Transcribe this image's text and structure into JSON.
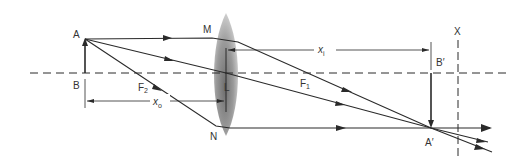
{
  "diagram": {
    "type": "thin converging lens ray diagram",
    "colors": {
      "ink": "#2a2a2a",
      "background": "#ffffff",
      "lens_light": "#c8c8c8",
      "lens_dark": "#6e6e6e"
    },
    "labels": {
      "A": "A",
      "B": "B",
      "M": "M",
      "N": "N",
      "L": "L",
      "F2": "F",
      "F2_sub": "2",
      "F1": "F",
      "F1_sub": "1",
      "xo": "x",
      "xo_sub": "o",
      "xi": "x",
      "xi_sub": "i",
      "A_prime": "A′",
      "B_prime": "B′",
      "X": "X"
    },
    "elements": {
      "optical_axis": "dashed horizontal line",
      "object": "upright arrow AB",
      "lens": "biconvex lens ML N",
      "image": "inverted arrow A′B′",
      "screen": "dashed vertical line X",
      "rays": [
        "parallel ray A→M→F1→A′",
        "central ray A→L→A′",
        "focal ray A→F2→N→A′"
      ],
      "distances": [
        "x_o: object distance B to L",
        "x_i: image distance L to B′"
      ]
    }
  }
}
